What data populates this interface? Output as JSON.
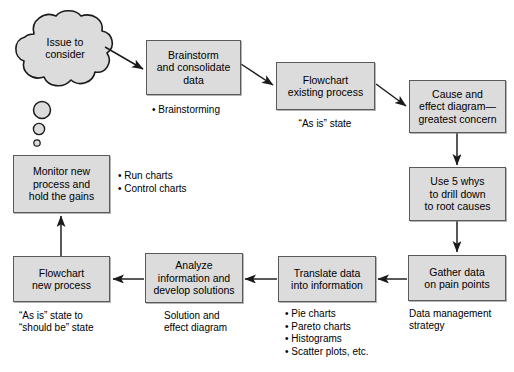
{
  "diagram": {
    "fill_color": "#dcdcdc",
    "border_color": "#5a5a5a",
    "background_color": "#ffffff"
  },
  "cloud": {
    "label": "Issue to\nconsider"
  },
  "nodes": [
    {
      "id": "brainstorm",
      "label": "Brainstorm\nand consolidate\ndata"
    },
    {
      "id": "flowchart-existing",
      "label": "Flowchart\nexisting process"
    },
    {
      "id": "cause-effect",
      "label": "Cause and\neffect diagram—\ngreatest concern"
    },
    {
      "id": "five-whys",
      "label": "Use 5 whys\nto drill down\nto root causes"
    },
    {
      "id": "gather-data",
      "label": "Gather data\non pain points"
    },
    {
      "id": "translate-data",
      "label": "Translate data\ninto information"
    },
    {
      "id": "analyze",
      "label": "Analyze\ninformation and\ndevelop solutions"
    },
    {
      "id": "flowchart-new",
      "label": "Flowchart\nnew process"
    },
    {
      "id": "monitor",
      "label": "Monitor new\nprocess and\nhold the gains"
    }
  ],
  "captions": [
    {
      "id": "flowchart-existing-caption",
      "text": "“As is” state"
    },
    {
      "id": "gather-data-caption",
      "text": "Data management\nstrategy"
    },
    {
      "id": "analyze-caption",
      "text": "Solution and\neffect diagram"
    },
    {
      "id": "flowchart-new-caption",
      "text": "“As is” state to\n“should be” state"
    }
  ],
  "bullet_groups": [
    {
      "id": "brainstorm-bullets",
      "items": "• Brainstorming"
    },
    {
      "id": "monitor-bullets",
      "items": "• Run charts\n• Control charts"
    },
    {
      "id": "translate-bullets",
      "items": "• Pie charts\n• Pareto charts\n• Histograms\n• Scatter plots, etc."
    }
  ],
  "footer": {
    "text": ""
  }
}
